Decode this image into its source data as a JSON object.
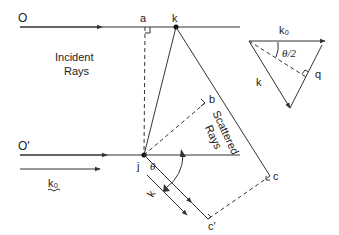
{
  "diagram": {
    "labels": {
      "O": "O",
      "O_prime": "O′",
      "a": "a",
      "k_point": "k",
      "b": "b",
      "j": "j",
      "c": "c",
      "c_prime": "c′",
      "theta": "θ",
      "incident_line1": "Incident",
      "incident_line2": "Rays",
      "scattered_line1": "Scattered",
      "scattered_line2": "Rays",
      "k0_incident": "k₀",
      "k_scattered": "k",
      "vector_k0": "k₀",
      "vector_k": "k",
      "vector_q": "q",
      "half_angle": "θ/2"
    },
    "colors": {
      "line": "#333333",
      "text": "#222222",
      "background": "#ffffff"
    }
  }
}
